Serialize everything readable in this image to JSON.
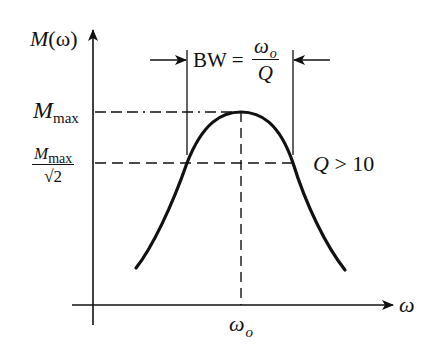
{
  "diagram": {
    "y_axis": {
      "label_main": "M",
      "label_arg": "(ω)"
    },
    "x_axis": {
      "label": "ω"
    },
    "center_frequency": {
      "label_main": "ω",
      "label_sub": "o"
    },
    "levels": {
      "max": {
        "label_main": "M",
        "label_sub": "max"
      },
      "half_power": {
        "numerator_main": "M",
        "numerator_sub": "max",
        "denominator": "√2"
      }
    },
    "bandwidth": {
      "lhs": "BW =",
      "numerator_main": "ω",
      "numerator_sub": "o",
      "denominator": "Q"
    },
    "condition": {
      "text_q": "Q",
      "text_rest": " > 10"
    },
    "colors": {
      "ink": "#111111",
      "background": "#ffffff"
    }
  }
}
